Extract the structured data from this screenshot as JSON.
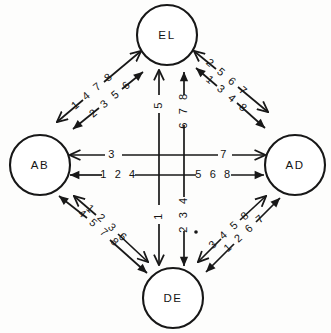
{
  "figure": {
    "type": "directed-graph-diagram",
    "background_color": "#fdfdfc",
    "ink_color": "#171717",
    "width": 331,
    "height": 333
  },
  "nodes": [
    {
      "id": "EL",
      "label": "EL",
      "cx": 167,
      "cy": 35,
      "r": 30
    },
    {
      "id": "AB",
      "label": "AB",
      "cx": 40,
      "cy": 165,
      "r": 30
    },
    {
      "id": "AD",
      "label": "AD",
      "cx": 295,
      "cy": 165,
      "r": 30
    },
    {
      "id": "DE",
      "label": "DE",
      "cx": 173,
      "cy": 298,
      "r": 30
    }
  ],
  "edges": [
    {
      "id": "el-ab-outer",
      "from": "EL",
      "to": "AB",
      "label": "1 4 7 8",
      "region": "upper-left-outer"
    },
    {
      "id": "ab-el-inner",
      "from": "AB",
      "to": "EL",
      "label": "2 3 5 6",
      "region": "upper-left-inner"
    },
    {
      "id": "el-ad-outer",
      "from": "EL",
      "to": "AD",
      "label": "2 5 6 7",
      "region": "upper-right-outer"
    },
    {
      "id": "ad-el-inner",
      "from": "AD",
      "to": "EL",
      "label": "1 3 4 8",
      "region": "upper-right-inner"
    },
    {
      "id": "ab-ad-upper-left",
      "from": "AB",
      "to": "AD",
      "label": "3",
      "region": "horizontal-upper-left"
    },
    {
      "id": "ab-ad-upper-right",
      "from": "AB",
      "to": "AD",
      "label": "7",
      "region": "horizontal-upper-right"
    },
    {
      "id": "ad-ab-lower-left",
      "from": "AD",
      "to": "AB",
      "label": "1 2 4",
      "region": "horizontal-lower-left"
    },
    {
      "id": "ad-ab-lower-right",
      "from": "AD",
      "to": "AB",
      "label": "5 6 8",
      "region": "horizontal-lower-right"
    },
    {
      "id": "el-de-left-upper",
      "from": "EL",
      "to": "DE",
      "label": "5",
      "region": "vertical-left-upper"
    },
    {
      "id": "el-de-left-lower",
      "from": "EL",
      "to": "DE",
      "label": "1",
      "region": "vertical-left-lower"
    },
    {
      "id": "de-el-right-upper",
      "from": "DE",
      "to": "EL",
      "label": "6 7 8",
      "region": "vertical-right-upper"
    },
    {
      "id": "el-de-right-lower",
      "from": "EL",
      "to": "DE",
      "label": "2 3 4",
      "region": "vertical-right-lower"
    },
    {
      "id": "de-ab-outer",
      "from": "DE",
      "to": "AB",
      "label": "4 5 7 8",
      "region": "lower-left-outer"
    },
    {
      "id": "ab-de-inner",
      "from": "AB",
      "to": "DE",
      "label": "1 2 3 6",
      "region": "lower-left-inner"
    },
    {
      "id": "de-ad-inner",
      "from": "DE",
      "to": "AD",
      "label": "3 4 5 8",
      "region": "lower-right-inner"
    },
    {
      "id": "ad-de-outer",
      "from": "AD",
      "to": "DE",
      "label": "1 2 6 7",
      "region": "lower-right-outer"
    }
  ],
  "marks": [
    {
      "id": "center-dot",
      "cx": 196,
      "cy": 232,
      "r": 1.8
    }
  ]
}
